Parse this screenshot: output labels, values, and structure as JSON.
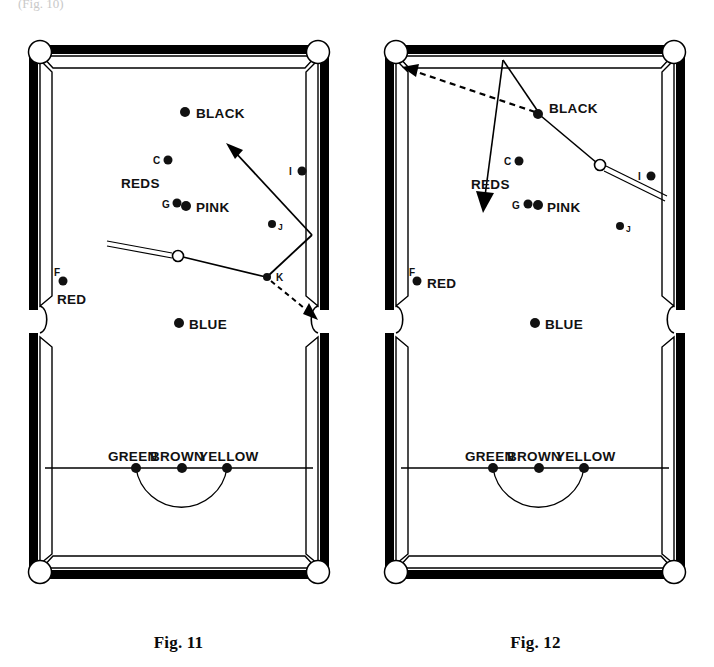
{
  "page": {
    "background": "#ffffff",
    "width": 714,
    "height": 667,
    "top_fragment": "(Fig. 10)"
  },
  "figures": [
    {
      "id": "fig11",
      "caption": "Fig. 11",
      "table": {
        "cloth_color": "#ffffff",
        "rail_color": "#000000",
        "cushion_color": "#ffffff"
      },
      "balls": [
        {
          "name": "black",
          "label": "BLACK",
          "label_side": "right",
          "x": 185,
          "y": 112,
          "r": 5
        },
        {
          "name": "red-c",
          "label": "C",
          "label_side": "left",
          "x": 168,
          "y": 160,
          "r": 4.5
        },
        {
          "name": "red-g",
          "label": "G",
          "label_side": "left",
          "x": 177,
          "y": 203,
          "r": 4.5
        },
        {
          "name": "pink",
          "label": "PINK",
          "label_side": "right",
          "x": 186,
          "y": 205,
          "r": 5
        },
        {
          "name": "red-i",
          "label": "I",
          "label_side": "left",
          "x": 302,
          "y": 171,
          "r": 4.5
        },
        {
          "name": "red-j",
          "label": "J",
          "label_side": "right",
          "x": 272,
          "y": 224,
          "r": 4
        },
        {
          "name": "red-f",
          "label": "F",
          "label_side": "above",
          "x": 63,
          "y": 281,
          "r": 4.5
        },
        {
          "name": "red-f-name",
          "label": "RED",
          "label_side": "below",
          "x": 63,
          "y": 281,
          "r": 0
        },
        {
          "name": "blue",
          "label": "BLUE",
          "label_side": "right",
          "x": 179,
          "y": 323,
          "r": 5
        },
        {
          "name": "green",
          "label": "GREEN",
          "label_side": "above",
          "x": 136,
          "y": 468,
          "r": 5
        },
        {
          "name": "brown",
          "label": "BROWN",
          "label_side": "above",
          "x": 182,
          "y": 468,
          "r": 5
        },
        {
          "name": "yellow",
          "label": "YELLOW",
          "label_side": "above",
          "x": 227,
          "y": 468,
          "r": 5
        }
      ],
      "group_labels": [
        {
          "name": "reds-cluster-label",
          "text": "REDS",
          "x": 118,
          "y": 188
        }
      ],
      "cue_ball": {
        "x": 178,
        "y": 256,
        "r": 5.5,
        "fill": "#ffffff"
      },
      "cue_stick": {
        "x1": 107,
        "y1": 243,
        "x2": 173,
        "y2": 255
      },
      "shot_lines": [
        {
          "name": "cue-to-object-line",
          "kind": "solid",
          "x1": 183,
          "y1": 257,
          "x2": 266,
          "y2": 277
        },
        {
          "name": "object-to-cushion-line",
          "kind": "solid",
          "x1": 268,
          "y1": 276,
          "x2": 312,
          "y2": 235
        },
        {
          "name": "cushion-rebound-arrow",
          "kind": "solid-arrow",
          "x1": 312,
          "y1": 235,
          "x2": 229,
          "y2": 146
        },
        {
          "name": "object-ball-to-pocket-arrow",
          "kind": "dashed-arrow",
          "x1": 271,
          "y1": 281,
          "x2": 316,
          "y2": 318
        }
      ],
      "contact_points": [
        {
          "name": "contact-point-k",
          "label": "K",
          "x": 267,
          "y": 277,
          "r": 4
        }
      ],
      "baulk": {
        "line_y": 468,
        "d_radius": 46,
        "d_center_x": 182
      }
    },
    {
      "id": "fig12",
      "caption": "Fig. 12",
      "table": {
        "cloth_color": "#ffffff",
        "rail_color": "#000000",
        "cushion_color": "#ffffff"
      },
      "balls": [
        {
          "name": "black",
          "label": "BLACK",
          "label_side": "right",
          "x": 538,
          "y": 114,
          "r": 5
        },
        {
          "name": "red-c",
          "label": "C",
          "label_side": "left",
          "x": 519,
          "y": 161,
          "r": 4.5
        },
        {
          "name": "red-g",
          "label": "G",
          "label_side": "left",
          "x": 528,
          "y": 204,
          "r": 4.5
        },
        {
          "name": "pink",
          "label": "PINK",
          "label_side": "right",
          "x": 537,
          "y": 205,
          "r": 5
        },
        {
          "name": "red-i",
          "label": "I",
          "label_side": "left",
          "x": 651,
          "y": 176,
          "r": 4.5
        },
        {
          "name": "red-j",
          "label": "J",
          "label_side": "right",
          "x": 620,
          "y": 226,
          "r": 4
        },
        {
          "name": "red-f",
          "label": "F",
          "label_side": "above",
          "x": 417,
          "y": 281,
          "r": 4.5
        },
        {
          "name": "red-f-name",
          "label": "RED",
          "label_side": "right",
          "x": 417,
          "y": 281,
          "r": 0
        },
        {
          "name": "blue",
          "label": "BLUE",
          "label_side": "right",
          "x": 535,
          "y": 323,
          "r": 5
        },
        {
          "name": "green",
          "label": "GREEN",
          "label_side": "above",
          "x": 493,
          "y": 468,
          "r": 5
        },
        {
          "name": "brown",
          "label": "BROWN",
          "label_side": "above",
          "x": 539,
          "y": 468,
          "r": 5
        },
        {
          "name": "yellow",
          "label": "YELLOW",
          "label_side": "above",
          "x": 584,
          "y": 468,
          "r": 5
        }
      ],
      "group_labels": [
        {
          "name": "reds-cluster-label",
          "text": "REDS",
          "x": 500,
          "y": 189
        }
      ],
      "cue_ball": {
        "x": 600,
        "y": 165,
        "r": 5.5,
        "fill": "#ffffff"
      },
      "cue_stick": {
        "x1": 607,
        "y1": 168,
        "x2": 665,
        "y2": 199
      },
      "shot_lines": [
        {
          "name": "cue-to-black-line",
          "kind": "solid",
          "x1": 596,
          "y1": 163,
          "x2": 540,
          "y2": 116
        },
        {
          "name": "black-to-pocket-dashed-arrow",
          "kind": "dashed-arrow",
          "x1": 536,
          "y1": 113,
          "x2": 404,
          "y2": 69
        },
        {
          "name": "cue-rebound-up-line",
          "kind": "solid",
          "x1": 540,
          "y1": 114,
          "x2": 503,
          "y2": 60
        },
        {
          "name": "cue-travel-down-arrow",
          "kind": "solid-arrow",
          "x1": 503,
          "y1": 60,
          "x2": 483,
          "y2": 209
        }
      ],
      "contact_points": [],
      "baulk": {
        "line_y": 468,
        "d_radius": 46,
        "d_center_x": 539
      }
    }
  ]
}
